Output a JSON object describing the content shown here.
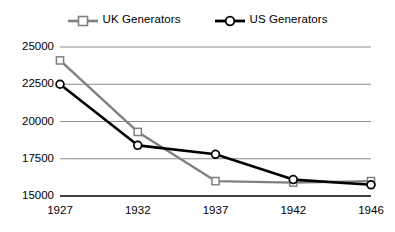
{
  "chart_data": {
    "type": "line",
    "title": "",
    "subtitle": "",
    "xlabel": "",
    "ylabel": "",
    "categories": [
      "1927",
      "1932",
      "1937",
      "1942",
      "1946"
    ],
    "x": [
      1927,
      1932,
      1937,
      1942,
      1946
    ],
    "series": [
      {
        "name": "UK Generators",
        "color": "#808080",
        "marker": "square-open",
        "values": [
          24100,
          19300,
          16000,
          15900,
          16000
        ]
      },
      {
        "name": "US Generators",
        "color": "#000000",
        "marker": "circle-open",
        "values": [
          22500,
          18400,
          17800,
          16100,
          15750
        ]
      }
    ],
    "ylim": [
      15000,
      25000
    ],
    "yticks": [
      25000,
      22500,
      20000,
      17500,
      15000
    ],
    "ytick_labels": [
      "25000",
      "22500",
      "20000",
      "17500",
      "15000"
    ],
    "xtick_labels": [
      "1927",
      "1932",
      "1937",
      "1942",
      "1946"
    ],
    "grid": "horizontal",
    "grid_color": "#7f7f7f",
    "axis_color": "#000000",
    "background": "#ffffff",
    "legend_position": "top-center",
    "legend_entries": [
      {
        "label": "UK Generators",
        "color": "#808080",
        "marker": "square-open"
      },
      {
        "label": "US Generators",
        "color": "#000000",
        "marker": "circle-open"
      }
    ]
  }
}
